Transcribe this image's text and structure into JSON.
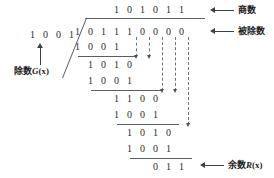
{
  "figure": {
    "type": "binary-polynomial-long-division",
    "quotient": {
      "label": "商数",
      "digits": [
        "1",
        "0",
        "1",
        "0",
        "1",
        "1"
      ]
    },
    "dividend": {
      "label": "被除数",
      "digits": [
        "1",
        "0",
        "1",
        "1",
        "1",
        "0",
        "0",
        "0",
        "0"
      ]
    },
    "divisor": {
      "label_prefix": "除数",
      "label_symbol": "G",
      "label_arg": "(x)",
      "digits": [
        "1",
        "0",
        "0",
        "1"
      ]
    },
    "remainder": {
      "label_prefix": "余数",
      "label_symbol": "R",
      "label_arg": "(x)",
      "digits": [
        "0",
        "1",
        "1"
      ]
    },
    "steps": [
      {
        "name": "subtrahend-1",
        "digits": [
          "1",
          "0",
          "0",
          "1"
        ]
      },
      {
        "name": "partial-1",
        "digits": [
          "1",
          "0",
          "1",
          "0"
        ]
      },
      {
        "name": "subtrahend-2",
        "digits": [
          "1",
          "0",
          "0",
          "1"
        ]
      },
      {
        "name": "partial-2",
        "digits": [
          "1",
          "1",
          "0",
          "0"
        ]
      },
      {
        "name": "subtrahend-3",
        "digits": [
          "1",
          "0",
          "0",
          "1"
        ]
      },
      {
        "name": "partial-3",
        "digits": [
          "1",
          "0",
          "1",
          "0"
        ]
      },
      {
        "name": "subtrahend-4",
        "digits": [
          "1",
          "0",
          "0",
          "1"
        ]
      }
    ],
    "colors": {
      "ink": "#2b2b2b",
      "rule": "#555f66",
      "dashed": "#6b747b",
      "arrow": "#3a4248",
      "background": "#ffffff"
    }
  }
}
